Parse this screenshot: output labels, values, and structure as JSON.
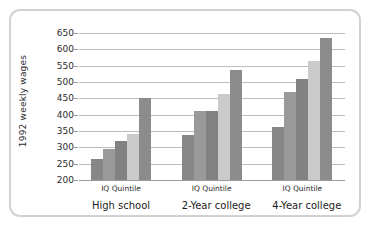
{
  "chart_data": {
    "type": "bar",
    "title": "",
    "subtitle": "",
    "xlabel": "",
    "ylabel": "1992 weekly wages",
    "ylim": [
      200,
      650
    ],
    "ytick_step": 50,
    "yticks": [
      200,
      250,
      300,
      350,
      400,
      450,
      500,
      550,
      600,
      650
    ],
    "grid": true,
    "legend": "none",
    "categories": [
      "High school",
      "2-Year college",
      "4-Year college"
    ],
    "group_axis_label": "IQ Quintile",
    "group_axis_labels": [
      "IQ Quintile",
      "IQ Quintile",
      "IQ Quintile"
    ],
    "series": [
      {
        "name": "Quintile 1",
        "color": "#878787",
        "values": [
          265,
          338,
          363
        ]
      },
      {
        "name": "Quintile 2",
        "color": "#9a9a9a",
        "values": [
          295,
          410,
          470
        ]
      },
      {
        "name": "Quintile 3",
        "color": "#828282",
        "values": [
          320,
          410,
          508
        ]
      },
      {
        "name": "Quintile 4",
        "color": "#cbcbcb",
        "values": [
          340,
          462,
          565
        ]
      },
      {
        "name": "Quintile 5",
        "color": "#8c8c8c",
        "values": [
          450,
          537,
          635
        ]
      }
    ]
  },
  "frame": {
    "border_color": "#d2d2d2",
    "background": "#ffffff"
  },
  "axis": {
    "grid_color": "#bcbcbc",
    "baseline_color": "#9a9a9a",
    "text_color": "#2b2b2b"
  }
}
